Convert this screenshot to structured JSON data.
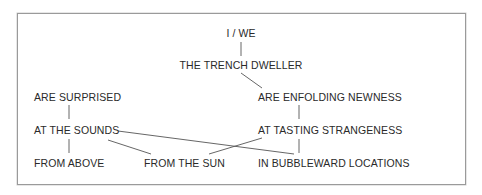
{
  "diagram": {
    "type": "dependency-tree",
    "line_color": "#555555",
    "text_color": "#2a2a2a",
    "nodes": [
      {
        "id": "i_we",
        "label": "I / WE"
      },
      {
        "id": "trench_dweller",
        "label": "THE TRENCH DWELLER"
      },
      {
        "id": "are_surprised",
        "label": "ARE SURPRISED"
      },
      {
        "id": "are_enfolding",
        "label": "ARE ENFOLDING NEWNESS"
      },
      {
        "id": "at_the_sounds",
        "label": "AT THE SOUNDS"
      },
      {
        "id": "at_tasting",
        "label": "AT TASTING STRANGENESS"
      },
      {
        "id": "from_above",
        "label": "FROM ABOVE"
      },
      {
        "id": "from_the_sun",
        "label": "FROM THE SUN"
      },
      {
        "id": "in_bubbleward",
        "label": "IN BUBBLEWARD LOCATIONS"
      }
    ],
    "edges": [
      [
        "i_we",
        "trench_dweller"
      ],
      [
        "trench_dweller",
        "are_enfolding"
      ],
      [
        "are_surprised",
        "at_the_sounds"
      ],
      [
        "at_the_sounds",
        "from_above"
      ],
      [
        "at_the_sounds",
        "from_the_sun"
      ],
      [
        "at_the_sounds",
        "in_bubbleward"
      ],
      [
        "are_enfolding",
        "at_tasting"
      ],
      [
        "at_tasting",
        "from_the_sun"
      ],
      [
        "at_tasting",
        "in_bubbleward"
      ]
    ]
  }
}
